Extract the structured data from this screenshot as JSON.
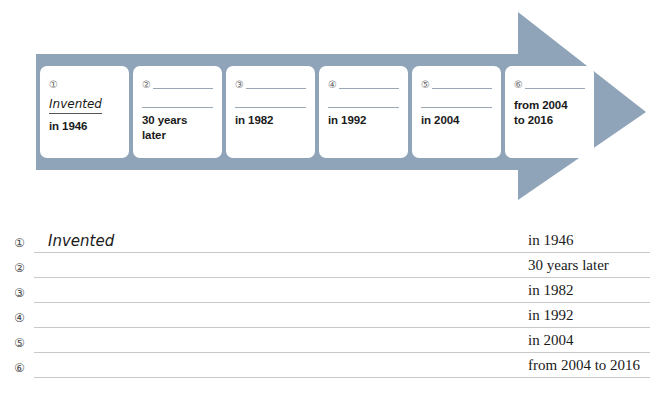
{
  "colors": {
    "arrow": "#8fa4b8",
    "card_bg": "#ffffff",
    "rule": "#c9c9c9",
    "card_rule": "#9aa7b4",
    "text": "#1a1a1a",
    "num": "#4a4a4a"
  },
  "timeline": {
    "name": "process-arrow-timeline",
    "direction": "left-to-right",
    "cards": [
      {
        "number": "①",
        "has_blank_top": false,
        "has_blank_mid": false,
        "handwritten": "Invented",
        "answer": "in 1946"
      },
      {
        "number": "②",
        "has_blank_top": true,
        "has_blank_mid": true,
        "handwritten": "",
        "answer": "30 years later"
      },
      {
        "number": "③",
        "has_blank_top": true,
        "has_blank_mid": true,
        "handwritten": "",
        "answer": "in 1982"
      },
      {
        "number": "④",
        "has_blank_top": true,
        "has_blank_mid": true,
        "handwritten": "",
        "answer": "in 1992"
      },
      {
        "number": "⑤",
        "has_blank_top": true,
        "has_blank_mid": true,
        "handwritten": "",
        "answer": "in 2004"
      },
      {
        "number": "⑥",
        "has_blank_top": true,
        "has_blank_mid": false,
        "handwritten": "",
        "answer": "from 2004\nto 2016"
      }
    ]
  },
  "answer_list": {
    "name": "numbered-answer-lines",
    "rows": [
      {
        "number": "①",
        "written": "Invented",
        "label": "in 1946"
      },
      {
        "number": "②",
        "written": "",
        "label": "30 years later"
      },
      {
        "number": "③",
        "written": "",
        "label": "in 1982"
      },
      {
        "number": "④",
        "written": "",
        "label": "in 1992"
      },
      {
        "number": "⑤",
        "written": "",
        "label": "in 2004"
      },
      {
        "number": "⑥",
        "written": "",
        "label": "from 2004 to 2016"
      }
    ]
  }
}
